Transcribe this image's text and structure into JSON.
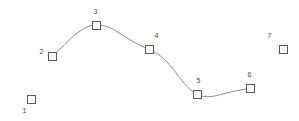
{
  "chart_data": {
    "type": "scatter",
    "title": "",
    "subtitle": "",
    "xlabel": "",
    "ylabel": "",
    "xlim": [
      0,
      299
    ],
    "ylim": [
      0,
      121
    ],
    "grid": false,
    "legend": null,
    "axes_visible": false,
    "marker_style": "open-square",
    "series": [
      {
        "name": "points",
        "connected_indices": [
          2,
          3,
          4,
          5,
          6
        ],
        "points": [
          {
            "label": "1",
            "x": 31.5,
            "y": 99.5,
            "connected": false,
            "label_dx": -9,
            "label_dy": 7
          },
          {
            "label": "2",
            "x": 52.5,
            "y": 56.5,
            "connected": true,
            "label_dx": -13,
            "label_dy": -9
          },
          {
            "label": "3",
            "x": 96.5,
            "y": 25.5,
            "connected": true,
            "label_dx": -3,
            "label_dy": -18
          },
          {
            "label": "4",
            "x": 149.5,
            "y": 49.5,
            "connected": true,
            "label_dx": 5,
            "label_dy": -18
          },
          {
            "label": "5",
            "x": 197.5,
            "y": 94.5,
            "connected": true,
            "label_dx": -1,
            "label_dy": -18
          },
          {
            "label": "6",
            "x": 250.5,
            "y": 88.5,
            "connected": true,
            "label_dx": -3,
            "label_dy": -18
          },
          {
            "label": "7",
            "x": 283.5,
            "y": 49.5,
            "connected": false,
            "label_dx": -16,
            "label_dy": -18
          }
        ]
      }
    ],
    "curve": {
      "style": "smooth-spline",
      "color": "#8c8c8c",
      "width": 1,
      "path": "M 52.5 56.5 C 62 48 76 31 88 26.5 C 97 23.3 108 25.5 117 31.5 C 128 38.8 140 46 149.5 49.5 C 159 53 168 62 177 74 C 184 83.5 190 91 197.5 94.5 C 206 98.4 214 96.5 223 94 C 233 91.2 243 89.3 250.5 88.5"
    },
    "colors": {
      "background": "#ffffff",
      "marker_border": "#595959",
      "marker_fill": "#ffffff",
      "curve": "#8c8c8c",
      "label_text": "#4a4a4a"
    }
  }
}
